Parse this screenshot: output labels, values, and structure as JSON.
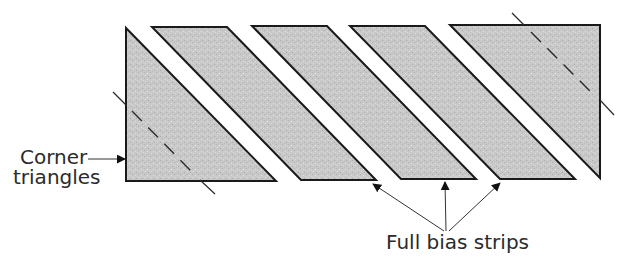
{
  "figure": {
    "type": "quilting-diagram",
    "colors": {
      "fill": "#c8c8c8",
      "outline": "#1a1a1a",
      "text": "#2b2b2b",
      "background": "#ffffff"
    },
    "pieces": [
      {
        "name": "corner-triangle-left",
        "kind": "corner triangle",
        "points": [
          [
            126,
            28
          ],
          [
            126,
            181
          ],
          [
            276,
            181
          ]
        ]
      },
      {
        "name": "bias-strip-1",
        "kind": "full bias strip",
        "points": [
          [
            152,
            27
          ],
          [
            227,
            27
          ],
          [
            376,
            180
          ],
          [
            301,
            180
          ]
        ]
      },
      {
        "name": "bias-strip-2",
        "kind": "full bias strip",
        "points": [
          [
            252,
            26
          ],
          [
            327,
            26
          ],
          [
            476,
            179
          ],
          [
            401,
            179
          ]
        ]
      },
      {
        "name": "bias-strip-3",
        "kind": "full bias strip",
        "points": [
          [
            350,
            26
          ],
          [
            425,
            26
          ],
          [
            575,
            179
          ],
          [
            500,
            179
          ]
        ]
      },
      {
        "name": "corner-triangle-right",
        "kind": "corner triangle (with strip portion)",
        "points": [
          [
            450,
            25
          ],
          [
            600,
            25
          ],
          [
            600,
            178
          ]
        ]
      }
    ],
    "cut_lines": [
      {
        "name": "seam-line-left",
        "from": [
          113,
          92
        ],
        "to": [
          215,
          193
        ]
      },
      {
        "name": "seam-line-right",
        "from": [
          512,
          13
        ],
        "to": [
          614,
          115
        ]
      }
    ]
  },
  "labels": {
    "corner_triangles_line1": "Corner",
    "corner_triangles_line2": "triangles",
    "full_bias_strips": "Full bias strips"
  }
}
